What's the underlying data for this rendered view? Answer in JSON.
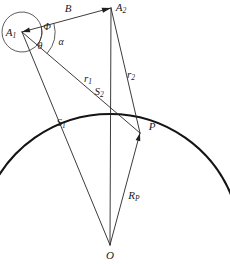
{
  "figure": {
    "type": "geometry-diagram",
    "background_color": "#ffffff",
    "line_color": "#262626",
    "arc_color": "#141414"
  },
  "points": [
    {
      "id": "A1",
      "label": "A",
      "subscript": "1",
      "x": 22,
      "y": 32,
      "label_x": 11,
      "label_y": 33
    },
    {
      "id": "A2",
      "label": "A",
      "subscript": "2",
      "x": 111,
      "y": 8,
      "label_x": 121,
      "label_y": 8
    },
    {
      "id": "P",
      "label": "P",
      "subscript": "",
      "x": 140,
      "y": 133,
      "label_x": 152,
      "label_y": 127
    },
    {
      "id": "O",
      "label": "O",
      "subscript": "",
      "x": 110,
      "y": 245,
      "label_x": 110,
      "label_y": 256
    }
  ],
  "segments": [
    {
      "id": "B",
      "label": "B",
      "subscript": "",
      "from": "A1",
      "to": "A2",
      "label_x": 68,
      "label_y": 9,
      "arrowhead": "end"
    },
    {
      "id": "r1",
      "label": "r",
      "subscript": "1",
      "from": "A1",
      "to": "P",
      "label_x": 88,
      "label_y": 79,
      "arrowhead": "none"
    },
    {
      "id": "r2",
      "label": "r",
      "subscript": "2",
      "from": "A2",
      "to": "P",
      "label_x": 131,
      "label_y": 75,
      "arrowhead": "none"
    },
    {
      "id": "S1",
      "label": "S",
      "subscript": "1",
      "from": "A1",
      "to": "O",
      "label_x": 61,
      "label_y": 123,
      "arrowhead": "none"
    },
    {
      "id": "S2",
      "label": "S",
      "subscript": "2",
      "from": "A2",
      "to": "O",
      "label_x": 99,
      "label_y": 92,
      "arrowhead": "none"
    },
    {
      "id": "RP",
      "label": "R",
      "subscript": "P",
      "from": "O",
      "to": "P",
      "label_x": 134,
      "label_y": 196,
      "arrowhead": "end"
    }
  ],
  "angles": [
    {
      "id": "Phi",
      "label": "Φ",
      "vertex": "A1",
      "label_x": 47,
      "label_y": 28,
      "arc_radius": 20
    },
    {
      "id": "alpha",
      "label": "α",
      "vertex": "A1",
      "label_x": 61,
      "label_y": 43,
      "arc_radius": 33
    },
    {
      "id": "theta",
      "label": "θ",
      "vertex": "A1",
      "label_x": 40,
      "label_y": 47,
      "arc_radius": 20
    }
  ],
  "arc": {
    "id": "planet-surface",
    "center": {
      "x": 110,
      "y": 245
    },
    "radius": 131,
    "start_angle_deg": 200,
    "end_angle_deg": 340,
    "stroke_width": 2.1
  },
  "labels": {
    "A1": "A",
    "A1_sub": "1",
    "A2": "A",
    "A2_sub": "2",
    "B": "B",
    "P": "P",
    "O": "O",
    "r1": "r",
    "r1_sub": "1",
    "r2": "r",
    "r2_sub": "2",
    "S1": "S",
    "S1_sub": "1",
    "S2": "S",
    "S2_sub": "2",
    "RP": "R",
    "RP_sub": "P",
    "Phi": "Φ",
    "alpha": "α",
    "theta": "θ"
  }
}
